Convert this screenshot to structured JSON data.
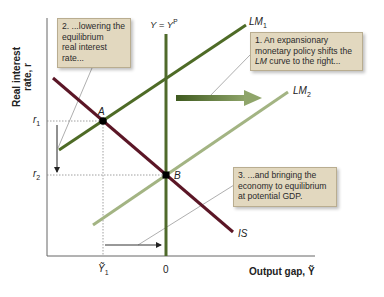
{
  "axes": {
    "y_title_line1": "Real interest",
    "y_title_line2": "rate, r",
    "x_title": "Output gap, Ỹ",
    "y_ticks": [
      {
        "label": "r1",
        "main": "r",
        "sub": "1"
      },
      {
        "label": "r2",
        "main": "r",
        "sub": "2"
      }
    ],
    "x_ticks": [
      {
        "label": "Ỹ1",
        "main": "Ỹ",
        "sub": "1"
      },
      {
        "label": "0",
        "main": "0",
        "sub": ""
      }
    ]
  },
  "curves": {
    "potential_label": "Y = Y",
    "potential_sup": "P",
    "lm1_label": "LM",
    "lm1_sub": "1",
    "lm2_label": "LM",
    "lm2_sub": "2",
    "is_label": "IS"
  },
  "points": {
    "a_label": "A",
    "b_label": "B"
  },
  "callouts": {
    "c1": {
      "line1": "1. An expansionary",
      "line2": "monetary policy shifts the",
      "line3_em": "LM",
      "line3_rest": " curve to the right..."
    },
    "c2": {
      "line1": "2. ...lowering the",
      "line2": "equilibrium",
      "line3": "real interest",
      "line4": "rate..."
    },
    "c3": {
      "line1": "3. ...and bringing the",
      "line2": "economy to equilibrium",
      "line3": "at potential GDP."
    }
  },
  "colors": {
    "lm1": "#4e6b26",
    "lm2": "#a3b483",
    "is": "#5b1626",
    "potential": "#4f6a2b",
    "shift_arrow": "#5d7a37",
    "callout_fill": "#e2d8bf",
    "axis": "#555555"
  }
}
